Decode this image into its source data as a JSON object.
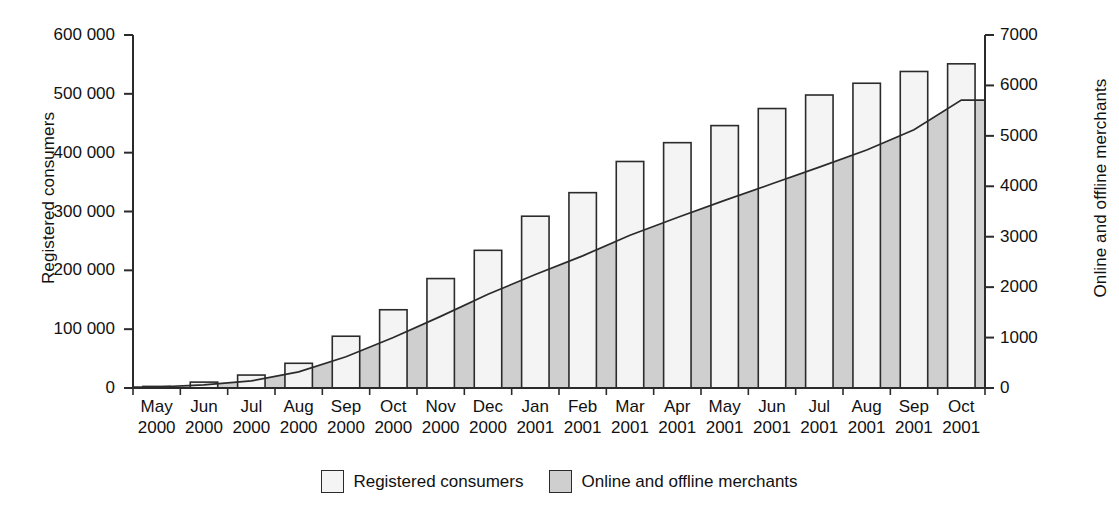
{
  "chart_data": {
    "type": "bar",
    "title": "",
    "xlabel": "",
    "ylabel": "Registered consumers",
    "y2label": "Online and offline merchants",
    "ylim": [
      0,
      600000
    ],
    "y2lim": [
      0,
      7000
    ],
    "grid": false,
    "legend_position": "bottom",
    "categories": [
      "May 2000",
      "Jun 2000",
      "Jul 2000",
      "Aug 2000",
      "Sep 2000",
      "Oct 2000",
      "Nov 2000",
      "Dec 2000",
      "Jan 2001",
      "Feb 2001",
      "Mar 2001",
      "Apr 2001",
      "May 2001",
      "Jun 2001",
      "Jul 2001",
      "Aug 2001",
      "Sep 2001",
      "Oct 2001"
    ],
    "category_months": [
      "May",
      "Jun",
      "Jul",
      "Aug",
      "Sep",
      "Oct",
      "Nov",
      "Dec",
      "Jan",
      "Feb",
      "Mar",
      "Apr",
      "May",
      "Jun",
      "Jul",
      "Aug",
      "Sep",
      "Oct"
    ],
    "category_years": [
      "2000",
      "2000",
      "2000",
      "2000",
      "2000",
      "2000",
      "2000",
      "2000",
      "2001",
      "2001",
      "2001",
      "2001",
      "2001",
      "2001",
      "2001",
      "2001",
      "2001",
      "2001"
    ],
    "y_ticks": [
      0,
      100000,
      200000,
      300000,
      400000,
      500000,
      600000
    ],
    "y_tick_labels": [
      "0",
      "100 000",
      "200 000",
      "300 000",
      "400 000",
      "500 000",
      "600 000"
    ],
    "y2_ticks": [
      0,
      1000,
      2000,
      3000,
      4000,
      5000,
      6000,
      7000
    ],
    "y2_tick_labels": [
      "0",
      "1000",
      "2000",
      "3000",
      "4000",
      "5000",
      "6000",
      "7000"
    ],
    "series": [
      {
        "name": "Registered consumers",
        "type": "bar",
        "axis": "left",
        "color": "#f4f4f4",
        "edge_color": "#2b2b2b",
        "values": [
          2000,
          10000,
          22000,
          42000,
          88000,
          133000,
          186000,
          234000,
          292000,
          332000,
          385000,
          417000,
          446000,
          475000,
          498000,
          518000,
          538000,
          551000
        ]
      },
      {
        "name": "Online and offline merchants",
        "type": "area",
        "axis": "right",
        "color": "#cfcfcf",
        "edge_color": "#2b2b2b",
        "values": [
          20,
          60,
          140,
          320,
          620,
          1000,
          1420,
          1860,
          2250,
          2620,
          3030,
          3380,
          3720,
          4050,
          4380,
          4720,
          5120,
          5710
        ]
      }
    ]
  },
  "legend": {
    "items": [
      {
        "label": "Registered consumers",
        "swatch": "bars"
      },
      {
        "label": "Online and offline merchants",
        "swatch": "area"
      }
    ]
  },
  "colors": {
    "bar_fill": "#f4f4f4",
    "area_fill": "#cfcfcf",
    "stroke": "#2b2b2b",
    "text": "#111111",
    "background": "#ffffff"
  }
}
